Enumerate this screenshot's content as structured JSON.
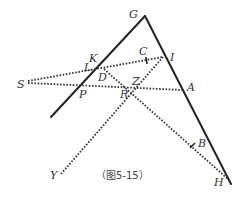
{
  "figure": {
    "caption": "（图5-15）",
    "colors": {
      "line": "#222222",
      "dotted": "#333333",
      "label": "#333333",
      "background": "#ffffff"
    },
    "points": {
      "G": {
        "label": "G",
        "x": 145,
        "y": 16
      },
      "K": {
        "label": "K",
        "x": 96,
        "y": 66
      },
      "L": {
        "label": "L",
        "x": 96,
        "y": 68
      },
      "C": {
        "label": "C",
        "x": 146,
        "y": 61
      },
      "I": {
        "label": "I",
        "x": 163,
        "y": 57
      },
      "S": {
        "label": "S",
        "x": 28,
        "y": 82
      },
      "D": {
        "label": "D",
        "x": 104,
        "y": 70
      },
      "P": {
        "label": "P",
        "x": 81,
        "y": 85
      },
      "Z": {
        "label": "Z",
        "x": 137,
        "y": 87
      },
      "R": {
        "label": "R",
        "x": 132,
        "y": 92
      },
      "A": {
        "label": "A",
        "x": 183,
        "y": 90
      },
      "B": {
        "label": "B",
        "x": 193,
        "y": 146
      },
      "H": {
        "label": "H",
        "x": 229,
        "y": 180
      },
      "Y": {
        "label": "Y",
        "x": 61,
        "y": 174
      }
    },
    "solid_lines": [
      {
        "from": "G",
        "to": "left_end",
        "x1": 145,
        "y1": 16,
        "x2": 51,
        "y2": 117
      },
      {
        "from": "G",
        "to": "H",
        "x1": 145,
        "y1": 16,
        "x2": 231,
        "y2": 184
      }
    ],
    "dotted_lines": [
      {
        "name": "S-I",
        "x1": 28,
        "y1": 82,
        "x2": 163,
        "y2": 57
      },
      {
        "name": "S-A",
        "x1": 28,
        "y1": 82,
        "x2": 183,
        "y2": 90
      },
      {
        "name": "D-H",
        "x1": 104,
        "y1": 69,
        "x2": 229,
        "y2": 180
      },
      {
        "name": "I-Y",
        "x1": 163,
        "y1": 57,
        "x2": 61,
        "y2": 174
      }
    ]
  }
}
